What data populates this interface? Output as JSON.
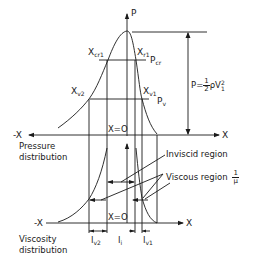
{
  "diagram": {
    "line_color": "#1a1a1a",
    "background": "#ffffff",
    "axes": {
      "p_axis_label": "P",
      "pressure_x_pos": "X",
      "pressure_x_neg": "-X",
      "viscosity_x_pos": "X",
      "viscosity_x_neg": "-X",
      "origin_pressure": "X=O",
      "origin_viscosity": "X=O"
    },
    "pressure_plot": {
      "title_line1": "Pressure",
      "title_line2": "distribution",
      "xcr1_main": "X",
      "xcr1_sub": "cr1",
      "xr1_main": "X",
      "xr1_sub": "r1",
      "pcr_main": "P",
      "pcr_sub": "cr",
      "xv2_main": "X",
      "xv2_sub": "v2",
      "xv1_main": "X",
      "xv1_sub": "v1",
      "pv_main": "P",
      "pv_sub": "v",
      "peak_formula_prefix": "P=",
      "peak_formula_num": "1",
      "peak_formula_den": "2",
      "peak_formula_suffix": "ρV",
      "peak_formula_sup": "2",
      "peak_formula_sub": "1"
    },
    "viscosity_plot": {
      "title_line1": "Viscosity",
      "title_line2": "distribution",
      "inviscid_label": "Inviscid region",
      "viscous_label": "Viscous region",
      "viscous_frac_num": "1",
      "viscous_frac_den": "μ",
      "lv2_main": "l",
      "lv2_sub": "v2",
      "li_main": "l",
      "li_sub": "i",
      "lv1_main": "l",
      "lv1_sub": "v1"
    }
  }
}
